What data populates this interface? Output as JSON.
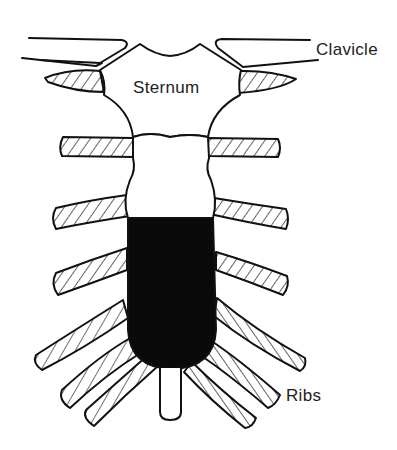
{
  "diagram": {
    "labels": {
      "clavicle": "Clavicle",
      "sternum": "Sternum",
      "ribs": "Ribs"
    },
    "colors": {
      "outline": "#111111",
      "background": "#ffffff",
      "shaded_region": "#0a0a0a",
      "hatch": "#111111"
    }
  }
}
